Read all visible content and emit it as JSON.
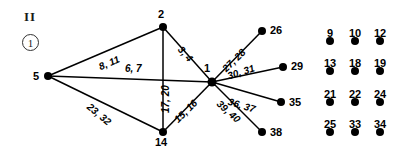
{
  "figure": {
    "corner_mark": "II",
    "panel_number": "1",
    "colors": {
      "node": "#000000",
      "edge": "#000000",
      "text": "#000000",
      "background": "#ffffff"
    }
  },
  "graph": {
    "nodes": [
      {
        "id": "2",
        "label": "2",
        "x": 163,
        "y": 27,
        "label_x": 158,
        "label_y": 8,
        "r": 4
      },
      {
        "id": "5",
        "label": "5",
        "x": 48,
        "y": 76,
        "label_x": 33,
        "label_y": 70,
        "r": 4
      },
      {
        "id": "1",
        "label": "1",
        "x": 212,
        "y": 82,
        "label_x": 204,
        "label_y": 62,
        "r": 4.5
      },
      {
        "id": "14",
        "label": "14",
        "x": 163,
        "y": 132,
        "label_x": 155,
        "label_y": 136,
        "r": 4
      },
      {
        "id": "26",
        "label": "26",
        "x": 262,
        "y": 31,
        "label_x": 270,
        "label_y": 24,
        "r": 4
      },
      {
        "id": "29",
        "label": "29",
        "x": 283,
        "y": 67,
        "label_x": 291,
        "label_y": 60,
        "r": 4
      },
      {
        "id": "35",
        "label": "35",
        "x": 281,
        "y": 102,
        "label_x": 289,
        "label_y": 96,
        "r": 4
      },
      {
        "id": "38",
        "label": "38",
        "x": 262,
        "y": 132,
        "label_x": 270,
        "label_y": 126,
        "r": 4
      }
    ],
    "edges": [
      {
        "from": "5",
        "to": "2",
        "label": "8, 11",
        "label_x": 97,
        "label_y": 62,
        "rotate": -23
      },
      {
        "from": "5",
        "to": "1",
        "label": "6, 7",
        "label_x": 125,
        "label_y": 63,
        "rotate": 0
      },
      {
        "from": "5",
        "to": "14",
        "label": "23, 32",
        "label_x": 92,
        "label_y": 101,
        "rotate": 40
      },
      {
        "from": "2",
        "to": "1",
        "label": "3, 4",
        "label_x": 184,
        "label_y": 44,
        "rotate": 48
      },
      {
        "from": "2",
        "to": "14",
        "label": "17, 20",
        "label_x": 160,
        "label_y": 113,
        "rotate": -90
      },
      {
        "from": "14",
        "to": "1",
        "label": "15, 16",
        "label_x": 172,
        "label_y": 117,
        "rotate": -45
      },
      {
        "from": "1",
        "to": "26",
        "label": "27, 28",
        "label_x": 220,
        "label_y": 66,
        "rotate": -44
      },
      {
        "from": "1",
        "to": "29",
        "label": "30, 31",
        "label_x": 226,
        "label_y": 71,
        "rotate": -18
      },
      {
        "from": "1",
        "to": "35",
        "label": "36, 37",
        "label_x": 230,
        "label_y": 96,
        "rotate": 17
      },
      {
        "from": "1",
        "to": "38",
        "label": "39, 40",
        "label_x": 222,
        "label_y": 98,
        "rotate": 42
      }
    ]
  },
  "isolated_nodes": {
    "columns_x": [
      330,
      355,
      380
    ],
    "rows_label_y": [
      27,
      57,
      88,
      118
    ],
    "rows_dot_y": [
      41,
      71,
      102,
      132
    ],
    "grid": [
      [
        "9",
        "10",
        "12"
      ],
      [
        "13",
        "18",
        "19"
      ],
      [
        "21",
        "22",
        "24"
      ],
      [
        "25",
        "33",
        "34"
      ]
    ],
    "dot_radius": 4
  }
}
